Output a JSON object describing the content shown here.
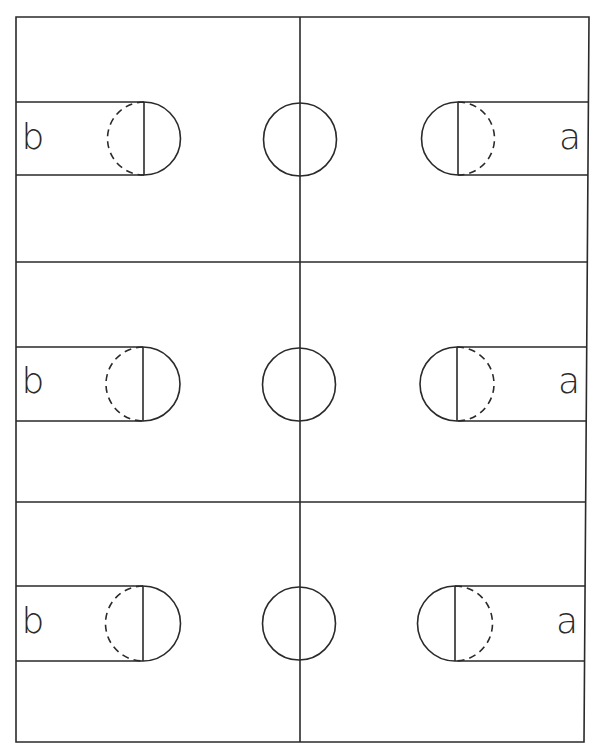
{
  "diagram": {
    "title": "",
    "stroke_color": "#2a2a2a",
    "background": "#ffffff",
    "courts": [
      {
        "id": "court-1",
        "left_label": "b",
        "right_label": "a",
        "top": 17,
        "bottom": 262,
        "center_y": 139.5,
        "key_top": 102,
        "key_bottom": 175,
        "left_ft_x": 144,
        "right_ft_x": 458,
        "center_circle": {
          "cx": 300,
          "cy": 139.5,
          "r": 36.5
        },
        "left_label_pos": {
          "x": 33,
          "y": 137
        },
        "right_label_pos": {
          "x": 570,
          "y": 137
        }
      },
      {
        "id": "court-2",
        "left_label": "b",
        "right_label": "a",
        "top": 262,
        "bottom": 502,
        "center_y": 384.5,
        "key_top": 347,
        "key_bottom": 421,
        "left_ft_x": 143,
        "right_ft_x": 457,
        "center_circle": {
          "cx": 299,
          "cy": 384.5,
          "r": 36.5
        },
        "left_label_pos": {
          "x": 33,
          "y": 381
        },
        "right_label_pos": {
          "x": 569,
          "y": 381
        }
      },
      {
        "id": "court-3",
        "left_label": "b",
        "right_label": "a",
        "top": 502,
        "bottom": 742,
        "center_y": 623.5,
        "key_top": 586,
        "key_bottom": 661,
        "left_ft_x": 143,
        "right_ft_x": 455,
        "center_circle": {
          "cx": 299,
          "cy": 623.5,
          "r": 36.5
        },
        "left_label_pos": {
          "x": 33,
          "y": 621
        },
        "right_label_pos": {
          "x": 567,
          "y": 621
        }
      }
    ],
    "frame": {
      "left": 16,
      "top": 17,
      "right_top": 589,
      "right_bottom": 584,
      "bottom": 742,
      "midline_x": 300
    }
  }
}
